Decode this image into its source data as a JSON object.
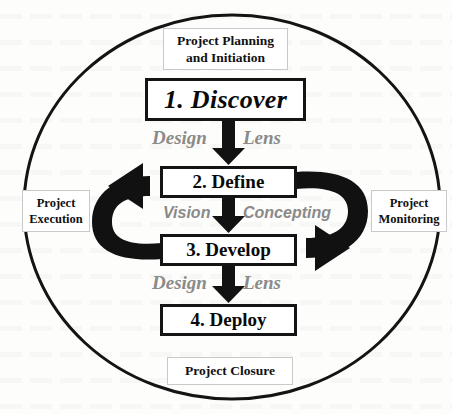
{
  "diagram": {
    "title_present": false,
    "shape": "ellipse-boundary-cycle",
    "colors": {
      "stroke": "#141414",
      "background": "#fdfdfc",
      "lens_text": "#8a8a8a",
      "label_border": "#c9c9c9",
      "arrow_fill": "#111111"
    },
    "boundary": {
      "name": "project-lifecycle-ellipse",
      "cx": 232,
      "cy": 207,
      "rx": 208,
      "ry": 192
    },
    "phases": [
      {
        "id": "discover",
        "label": "1. Discover",
        "style": "bold-italic-serif"
      },
      {
        "id": "define",
        "label": "2. Define",
        "style": "bold-serif"
      },
      {
        "id": "develop",
        "label": "3. Develop",
        "style": "bold-serif"
      },
      {
        "id": "deploy",
        "label": "4. Deploy",
        "style": "bold-serif"
      }
    ],
    "stage_labels": {
      "top": "Project Planning and Initiation",
      "top_line1": "Project Planning",
      "top_line2": "and Initiation",
      "bottom": "Project Closure",
      "left_line1": "Project",
      "left_line2": "Execution",
      "right_line1": "Project",
      "right_line2": "Monitoring"
    },
    "transition_labels": [
      {
        "id": "discover-to-define-left",
        "text": "Design"
      },
      {
        "id": "discover-to-define-right",
        "text": "Lens"
      },
      {
        "id": "define-to-develop-left",
        "text": "Vision"
      },
      {
        "id": "define-to-develop-right",
        "text": "Concepting"
      },
      {
        "id": "develop-to-deploy-left",
        "text": "Design"
      },
      {
        "id": "develop-to-deploy-right",
        "text": "Lens"
      }
    ],
    "connectors": [
      {
        "id": "arrow-discover-define",
        "type": "straight-down"
      },
      {
        "id": "arrow-define-develop",
        "type": "straight-down"
      },
      {
        "id": "arrow-develop-deploy",
        "type": "straight-down"
      },
      {
        "id": "arrow-develop-to-define-loop",
        "type": "curved-left-upward"
      },
      {
        "id": "arrow-define-to-develop-loop",
        "type": "curved-right-downward"
      }
    ]
  }
}
